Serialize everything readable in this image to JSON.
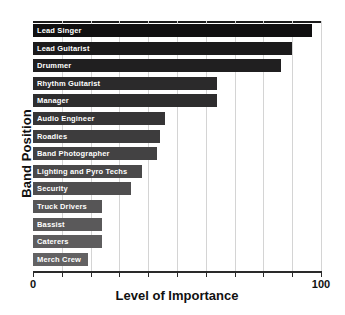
{
  "chart_data": {
    "type": "bar",
    "orientation": "horizontal",
    "title": "",
    "xlabel": "Level of Importance",
    "ylabel": "Band Position",
    "xlim": [
      0,
      100
    ],
    "xticks": [
      0,
      10,
      20,
      30,
      40,
      50,
      60,
      70,
      80,
      90,
      100
    ],
    "xtick_labels": [
      "0",
      "",
      "",
      "",
      "",
      "",
      "",
      "",
      "",
      "",
      "100"
    ],
    "grid": true,
    "legend": "none",
    "categories": [
      "Lead Singer",
      "Lead Guitarist",
      "Drummer",
      "Rhythm Guitarist",
      "Manager",
      "Audio Engineer",
      "Roadies",
      "Band Photographer",
      "Lighting and Pyro Techs",
      "Security",
      "Truck Drivers",
      "Bassist",
      "Caterers",
      "Merch Crew"
    ],
    "values": [
      97,
      90,
      86,
      64,
      64,
      46,
      44,
      43,
      38,
      34,
      24,
      24,
      24,
      19
    ],
    "bar_colors": [
      "#100f10",
      "#1b1a1b",
      "#201f20",
      "#2b2a2b",
      "#2e2d2e",
      "#363536",
      "#3d3c3d",
      "#434243",
      "#4a494a",
      "#4f4e4f",
      "#565556",
      "#5a595a",
      "#5e5d5e",
      "#636263"
    ]
  },
  "axis": {
    "y_title": "Band Position",
    "x_title": "Level of Importance",
    "x_min_label": "0",
    "x_max_label": "100"
  },
  "colors": {
    "background": "#ffffff",
    "gridline": "#d4d4d4",
    "axis": "#2a2a2a",
    "bar_label_text": "#ffffff",
    "axis_text": "#111111"
  }
}
